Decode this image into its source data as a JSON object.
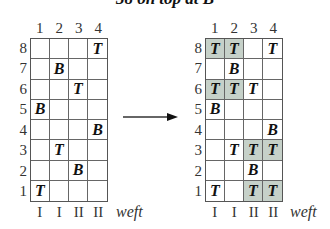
{
  "title": "38 on top at B",
  "arrow": "right-arrow",
  "shade_color": "#c6d1c9",
  "column_numbers": [
    "1",
    "2",
    "3",
    "4"
  ],
  "row_numbers": [
    "8",
    "7",
    "6",
    "5",
    "4",
    "3",
    "2",
    "1"
  ],
  "weft_labels": [
    "I",
    "I",
    "II",
    "II"
  ],
  "weft_label": "weft",
  "left_grid": {
    "rows": [
      [
        "",
        "",
        "",
        "T"
      ],
      [
        "",
        "B",
        "",
        ""
      ],
      [
        "",
        "",
        "T",
        ""
      ],
      [
        "B",
        "",
        "",
        ""
      ],
      [
        "",
        "",
        "",
        "B"
      ],
      [
        "",
        "T",
        "",
        ""
      ],
      [
        "",
        "",
        "B",
        ""
      ],
      [
        "T",
        "",
        "",
        ""
      ]
    ],
    "shaded": [
      [
        false,
        false,
        false,
        false
      ],
      [
        false,
        false,
        false,
        false
      ],
      [
        false,
        false,
        false,
        false
      ],
      [
        false,
        false,
        false,
        false
      ],
      [
        false,
        false,
        false,
        false
      ],
      [
        false,
        false,
        false,
        false
      ],
      [
        false,
        false,
        false,
        false
      ],
      [
        false,
        false,
        false,
        false
      ]
    ]
  },
  "right_grid": {
    "rows": [
      [
        "T",
        "T",
        "",
        "T"
      ],
      [
        "",
        "B",
        "",
        ""
      ],
      [
        "T",
        "T",
        "T",
        ""
      ],
      [
        "B",
        "",
        "",
        ""
      ],
      [
        "",
        "",
        "",
        "B"
      ],
      [
        "",
        "T",
        "T",
        "T"
      ],
      [
        "",
        "",
        "B",
        ""
      ],
      [
        "T",
        "",
        "T",
        "T"
      ]
    ],
    "shaded": [
      [
        true,
        true,
        false,
        false
      ],
      [
        false,
        false,
        false,
        false
      ],
      [
        true,
        true,
        false,
        false
      ],
      [
        false,
        false,
        false,
        false
      ],
      [
        false,
        false,
        false,
        false
      ],
      [
        false,
        false,
        true,
        true
      ],
      [
        false,
        false,
        false,
        false
      ],
      [
        false,
        false,
        true,
        true
      ]
    ]
  }
}
